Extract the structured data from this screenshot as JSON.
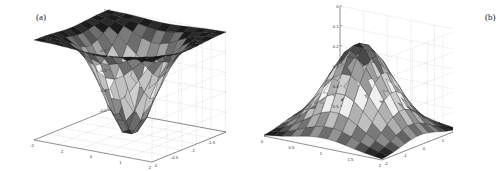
{
  "figure": {
    "background": "#ffffff",
    "width": 453,
    "height": 171
  },
  "panels": [
    {
      "id": "a",
      "label": "(a)",
      "zticks": [
        "0",
        "-0.1",
        "-0.2",
        "-0.3",
        "-0.4",
        "-0.5"
      ],
      "xticks": [
        "-2",
        "-1",
        "0",
        "1",
        "2"
      ],
      "yticks": [
        "0",
        "-0.5",
        "-1",
        "-1.5",
        "-2"
      ]
    },
    {
      "id": "b",
      "label": "(b)",
      "zticks": [
        "0.5",
        "0.4",
        "0.3",
        "0.2",
        "0.1",
        "0"
      ],
      "xticks": [
        "0",
        "0.5",
        "1",
        "1.5",
        "2"
      ],
      "yticks": [
        "-2",
        "-1",
        "0",
        "1",
        "2"
      ]
    }
  ],
  "chart_data": [
    {
      "type": "surface",
      "panel": "a",
      "title": "(a)",
      "xlabel": "",
      "ylabel": "",
      "zlabel": "",
      "xlim": [
        -2,
        2
      ],
      "ylim": [
        -2,
        0
      ],
      "zlim": [
        -0.5,
        0
      ],
      "xticks": [
        -2,
        -1,
        0,
        1,
        2
      ],
      "yticks": [
        0,
        -0.5,
        -1,
        -1.5,
        -2
      ],
      "zticks": [
        0,
        -0.1,
        -0.2,
        -0.3,
        -0.4,
        -0.5
      ],
      "grid": true,
      "colormap": "gray",
      "description": "Negative Gaussian-like well surface, minimum approximately -0.5 near the center, flattening to 0 at the edges",
      "surface_function": "z = -0.5 * exp(-(x^2 + y^2))",
      "z_min": -0.5,
      "z_max": 0.0,
      "grid_n": 13
    },
    {
      "type": "surface",
      "panel": "b",
      "title": "(b)",
      "xlabel": "",
      "ylabel": "",
      "zlabel": "",
      "xlim": [
        0,
        2
      ],
      "ylim": [
        -2,
        2
      ],
      "zlim": [
        0,
        0.5
      ],
      "xticks": [
        0,
        0.5,
        1,
        1.5,
        2
      ],
      "yticks": [
        -2,
        -1,
        0,
        1,
        2
      ],
      "zticks": [
        0,
        0.1,
        0.2,
        0.3,
        0.4,
        0.5
      ],
      "grid": true,
      "colormap": "gray",
      "description": "Positive Gaussian peak surface, maximum approximately 0.45 near the center, decaying to 0 at the edges",
      "surface_function": "z = 0.45 * exp(-(x^2 + y^2))",
      "z_min": 0.0,
      "z_max": 0.45,
      "grid_n": 13
    }
  ]
}
